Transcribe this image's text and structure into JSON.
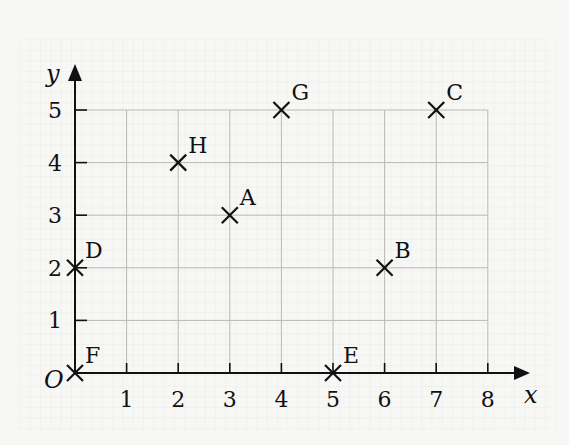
{
  "chart_data": {
    "type": "scatter",
    "title": "",
    "xlabel": "x",
    "ylabel": "y",
    "origin_label": "O",
    "xlim": [
      0,
      8
    ],
    "ylim": [
      0,
      5
    ],
    "x_ticks": [
      1,
      2,
      3,
      4,
      5,
      6,
      7,
      8
    ],
    "y_ticks": [
      1,
      2,
      3,
      4,
      5
    ],
    "grid": true,
    "marker": "x",
    "points": [
      {
        "label": "A",
        "x": 3,
        "y": 3
      },
      {
        "label": "B",
        "x": 6,
        "y": 2
      },
      {
        "label": "C",
        "x": 7,
        "y": 5
      },
      {
        "label": "D",
        "x": 0,
        "y": 2
      },
      {
        "label": "E",
        "x": 5,
        "y": 0
      },
      {
        "label": "F",
        "x": 0,
        "y": 0
      },
      {
        "label": "G",
        "x": 4,
        "y": 5
      },
      {
        "label": "H",
        "x": 2,
        "y": 4
      }
    ]
  },
  "colors": {
    "background": "#f7f7f5",
    "grid": "#b8b8b8",
    "minor_grid": "#ececea",
    "axis": "#111111",
    "marker": "#111111"
  }
}
